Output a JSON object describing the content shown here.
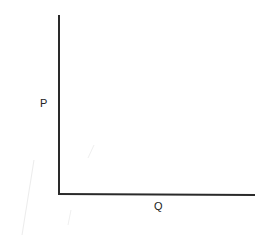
{
  "diagram": {
    "type": "axes",
    "y_axis": {
      "label": "P"
    },
    "x_axis": {
      "label": "Q"
    },
    "colors": {
      "axis": "#2a2a2a",
      "label": "#222222",
      "background": "#ffffff",
      "artifact": "#e6e6e6"
    }
  }
}
